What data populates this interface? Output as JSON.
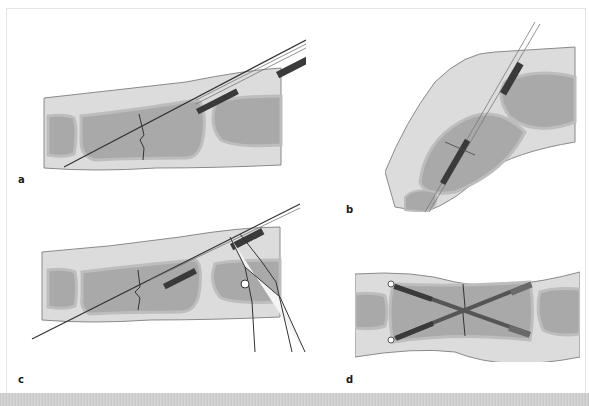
{
  "figure": {
    "panels": [
      {
        "id": "a",
        "label": "a",
        "description": "Wire inserted obliquely across phalanx fracture with cannulated screw advancing"
      },
      {
        "id": "b",
        "label": "b",
        "description": "Flexed finger view with screw advanced along guide wire"
      },
      {
        "id": "c",
        "label": "c",
        "description": "Pliers cutting/holding wire at screw end"
      },
      {
        "id": "d",
        "label": "d",
        "description": "Two crossed screws fixing the fracture"
      }
    ]
  },
  "colors": {
    "soft_tissue": "#dcdcdc",
    "bone_cortex": "#c8c8c8",
    "bone_marrow": "#a9a9a9",
    "outline": "#7a7a7a",
    "screw": "#3a3a3a",
    "wire": "#555555",
    "background": "#ffffff"
  }
}
